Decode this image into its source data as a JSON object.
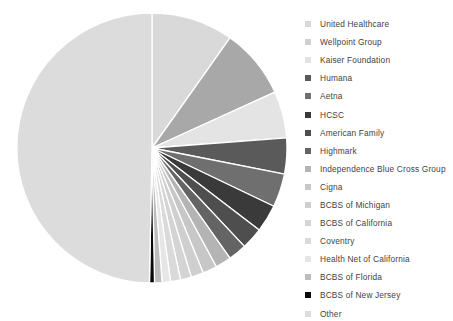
{
  "chart_data": {
    "type": "pie",
    "title": "",
    "subtitle": "",
    "xlabel": "",
    "ylabel": "",
    "legend_position": "right",
    "grid": false,
    "start_angle_deg": 0,
    "direction": "clockwise",
    "categories": [
      "United Healthcare",
      "Wellpoint Group",
      "Kaiser Foundation",
      "Humana",
      "Aetna",
      "HCSC",
      "American Family",
      "Highmark",
      "Independence Blue Cross Group",
      "Cigna",
      "BCBS of Michigan",
      "BCBS of California",
      "Coventry",
      "Health Net of California",
      "BCBS of Florida",
      "BCBS of New Jersey",
      "Other"
    ],
    "values": [
      9.8,
      8.4,
      5.6,
      4.3,
      4.0,
      3.3,
      2.6,
      2.2,
      1.9,
      1.7,
      1.5,
      1.3,
      1.2,
      1.0,
      0.9,
      0.6,
      49.7
    ],
    "colors": [
      "#d9d9d9",
      "#a8a8a8",
      "#e4e4e4",
      "#5a5a5a",
      "#6f6f6f",
      "#3a3a3a",
      "#4e4e4e",
      "#646464",
      "#b4b4b4",
      "#c7c7c7",
      "#cfcfcf",
      "#d4d4d4",
      "#dadada",
      "#e6e6e6",
      "#bdbdbd",
      "#0a0a0a",
      "#dcdcdc"
    ]
  },
  "legend": {
    "items": [
      {
        "label": "United Healthcare",
        "color": "#d9d9d9"
      },
      {
        "label": "Wellpoint Group",
        "color": "#cfcfcf"
      },
      {
        "label": "Kaiser Foundation",
        "color": "#e2e2e2"
      },
      {
        "label": "Humana",
        "color": "#5a5a5a"
      },
      {
        "label": "Aetna",
        "color": "#6f6f6f"
      },
      {
        "label": "HCSC",
        "color": "#3a3a3a"
      },
      {
        "label": "American Family",
        "color": "#4e4e4e"
      },
      {
        "label": "Highmark",
        "color": "#646464"
      },
      {
        "label": "Independence Blue Cross Group",
        "color": "#b4b4b4"
      },
      {
        "label": "Cigna",
        "color": "#c7c7c7"
      },
      {
        "label": "BCBS of Michigan",
        "color": "#cfcfcf"
      },
      {
        "label": "BCBS of California",
        "color": "#d4d4d4"
      },
      {
        "label": "Coventry",
        "color": "#dadada"
      },
      {
        "label": "Health Net of California",
        "color": "#e6e6e6"
      },
      {
        "label": "BCBS of Florida",
        "color": "#bdbdbd"
      },
      {
        "label": "BCBS of New Jersey",
        "color": "#0a0a0a"
      },
      {
        "label": "Other",
        "color": "#dcdcdc"
      }
    ]
  },
  "pie_geometry": {
    "center_x": 152,
    "center_y": 148,
    "radius": 135,
    "separator_color": "#ffffff",
    "separator_width": 1.3
  }
}
